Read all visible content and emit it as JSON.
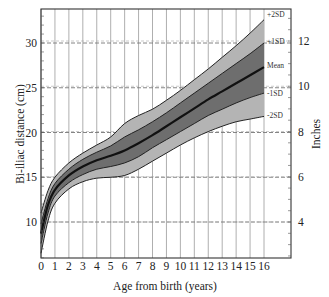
{
  "chart_data": {
    "type": "area",
    "title": "",
    "xlabel": "Age from birth (years)",
    "ylabel": "Bi-iliac distance (cm)",
    "ylabel_right": "Inches",
    "x_ticks": [
      0,
      1,
      2,
      3,
      4,
      5,
      6,
      7,
      8,
      9,
      10,
      11,
      12,
      13,
      14,
      15,
      16
    ],
    "y_ticks": [
      10,
      15,
      20,
      25,
      30
    ],
    "y_ticks_right": [
      4,
      6,
      8,
      10,
      12
    ],
    "xlim": [
      0,
      16
    ],
    "ylim": [
      6,
      33.8
    ],
    "grid": {
      "vertical": true,
      "horizontal_dashed_cm": [
        10,
        15,
        20,
        25,
        30
      ],
      "horizontal_dashed_in": [
        4,
        6,
        8,
        10,
        12
      ]
    },
    "legend_position": "right inline labels",
    "x": [
      0,
      0.5,
      1,
      2,
      3,
      4,
      5,
      6,
      7,
      8,
      9,
      10,
      11,
      12,
      13,
      14,
      15,
      16
    ],
    "series": [
      {
        "name": "+2SD",
        "values": [
          11.0,
          13.5,
          15.0,
          16.6,
          17.7,
          18.6,
          19.5,
          21.0,
          21.9,
          22.6,
          23.6,
          24.7,
          25.9,
          27.1,
          28.4,
          29.7,
          31.1,
          32.6
        ]
      },
      {
        "name": "+1SD",
        "values": [
          9.8,
          12.6,
          14.3,
          15.9,
          17.0,
          17.8,
          18.5,
          19.5,
          20.3,
          21.2,
          22.2,
          23.3,
          24.4,
          25.5,
          26.6,
          27.7,
          28.8,
          30.0
        ]
      },
      {
        "name": "Mean",
        "values": [
          8.7,
          11.9,
          13.6,
          15.2,
          16.2,
          16.9,
          17.4,
          18.0,
          18.8,
          19.7,
          20.7,
          21.7,
          22.7,
          23.7,
          24.6,
          25.5,
          26.4,
          27.3
        ]
      },
      {
        "name": "-1SD",
        "values": [
          7.6,
          11.0,
          12.9,
          14.4,
          15.3,
          15.9,
          16.2,
          16.6,
          17.3,
          18.3,
          19.2,
          20.1,
          21.0,
          21.9,
          22.6,
          23.3,
          23.9,
          24.4
        ]
      },
      {
        "name": "-2SD",
        "values": [
          6.5,
          10.1,
          12.1,
          13.7,
          14.5,
          14.9,
          15.0,
          15.2,
          15.9,
          16.8,
          17.7,
          18.6,
          19.4,
          20.1,
          20.7,
          21.2,
          21.5,
          21.8
        ]
      }
    ],
    "annotations": [
      "+2SD",
      "+1SD",
      "Mean",
      "-1SD",
      "-2SD"
    ],
    "colors": {
      "outer_band": "#b4b4b4",
      "inner_band": "#6e6e6e",
      "mean_line": "#111111",
      "grid": "#9a9a9a"
    }
  }
}
